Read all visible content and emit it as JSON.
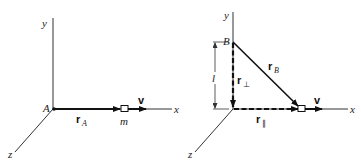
{
  "left_panel": {
    "axes": {
      "x": "x",
      "y": "y",
      "z": "z"
    },
    "origin_label": "A",
    "position_vector": {
      "symbol": "r",
      "subscript": "A"
    },
    "mass_label": "m",
    "velocity_label": "v"
  },
  "right_panel": {
    "axes": {
      "x": "x",
      "y": "y",
      "z": "z"
    },
    "point_label": "B",
    "distance_label": "l",
    "position_vector": {
      "symbol": "r",
      "subscript": "B"
    },
    "perp_vector": {
      "symbol": "r",
      "subscript": "⊥"
    },
    "parallel_vector": {
      "symbol": "r",
      "subscript": "∥"
    },
    "velocity_label": "v"
  },
  "colors": {
    "ink": "#111111",
    "axis": "#333333",
    "background": "#ffffff"
  }
}
